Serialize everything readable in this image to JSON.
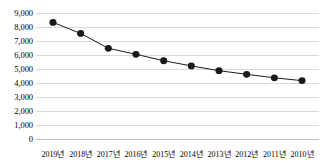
{
  "chart_data": {
    "type": "line",
    "title": "",
    "subtitle": "",
    "xlabel": "",
    "ylabel": "",
    "categories": [
      "2019년",
      "2018년",
      "2017년",
      "2016년",
      "2015년",
      "2014년",
      "2013년",
      "2012년",
      "2011년",
      "2010년"
    ],
    "values": [
      8330,
      7540,
      6480,
      6050,
      5590,
      5220,
      4880,
      4620,
      4370,
      4170
    ],
    "series": [
      {
        "name": "",
        "values": [
          8330,
          7540,
          6480,
          6050,
          5590,
          5220,
          4880,
          4620,
          4370,
          4170
        ]
      }
    ],
    "ylim": [
      0,
      9000
    ],
    "ytick_step": 1000,
    "ytick_labels": [
      "9,000",
      "8,000",
      "7,000",
      "6,000",
      "5,000",
      "4,000",
      "3,000",
      "2,000",
      "1,000",
      "0"
    ],
    "ytick_values": [
      9000,
      8000,
      7000,
      6000,
      5000,
      4000,
      3000,
      2000,
      1000,
      0
    ],
    "grid": "horizontal",
    "legend": "none",
    "line_color": "#1a1a1a",
    "marker_color": "#1a1a1a",
    "marker_shape": "circle",
    "gridline_color": "#d9d9d9",
    "background_color": "#ffffff",
    "annotations": []
  }
}
